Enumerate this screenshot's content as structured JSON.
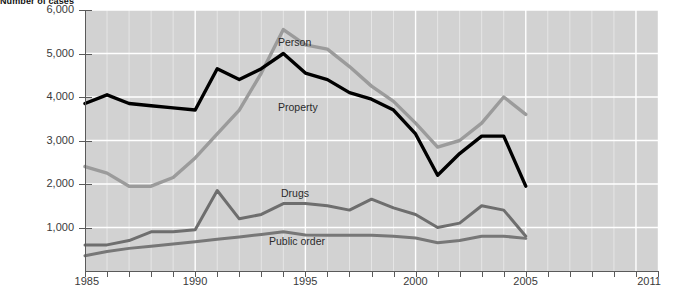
{
  "chart_title": "Number of cases",
  "axes": {
    "y_ticks": [
      "1,000",
      "2,000",
      "3,000",
      "4,000",
      "5,000",
      "6,000"
    ],
    "x_ticks": [
      "1985",
      "1990",
      "1995",
      "2000",
      "2005",
      "2011"
    ]
  },
  "series_labels": {
    "person": "Person",
    "property": "Property",
    "drugs": "Drugs",
    "public_order": "Public order"
  },
  "colors": {
    "person": "#9b9b9b",
    "property": "#000000",
    "drugs": "#6e6e6e",
    "public_order": "#777777",
    "plot_background": "#d2d2d2",
    "gridline": "#ffffff",
    "axis": "#5a5a5a"
  },
  "chart_data": {
    "type": "line",
    "title": "Number of cases",
    "xlabel": "",
    "ylabel": "Number of cases",
    "xlim": [
      1985,
      2011
    ],
    "ylim": [
      0,
      6000
    ],
    "ytick_values": [
      1000,
      2000,
      3000,
      4000,
      5000,
      6000
    ],
    "xtick_values": [
      1985,
      1990,
      1995,
      2000,
      2005,
      2011
    ],
    "grid": true,
    "legend": "inline-labels",
    "x": [
      1985,
      1986,
      1987,
      1988,
      1989,
      1990,
      1991,
      1992,
      1993,
      1994,
      1995,
      1996,
      1997,
      1998,
      1999,
      2000,
      2001,
      2002,
      2003,
      2004,
      2005
    ],
    "series": [
      {
        "name": "Person",
        "color": "#9b9b9b",
        "values": [
          2400,
          2250,
          1950,
          1950,
          2150,
          2600,
          3150,
          3700,
          4550,
          5550,
          5200,
          5100,
          4700,
          4250,
          3900,
          3400,
          2850,
          3000,
          3400,
          4000,
          3600
        ]
      },
      {
        "name": "Property",
        "color": "#000000",
        "values": [
          3850,
          4050,
          3850,
          3800,
          3750,
          3700,
          4650,
          4400,
          4650,
          5000,
          4550,
          4400,
          4100,
          3950,
          3700,
          3150,
          2200,
          2700,
          3100,
          3100,
          1950
        ]
      },
      {
        "name": "Drugs",
        "color": "#6e6e6e",
        "values": [
          600,
          600,
          700,
          900,
          900,
          950,
          1850,
          1200,
          1300,
          1550,
          1550,
          1500,
          1400,
          1650,
          1450,
          1300,
          1000,
          1100,
          1500,
          1400,
          800
        ]
      },
      {
        "name": "Public order",
        "color": "#777777",
        "values": [
          350,
          450,
          520,
          570,
          620,
          670,
          730,
          780,
          840,
          900,
          830,
          820,
          820,
          820,
          800,
          760,
          650,
          700,
          800,
          800,
          750
        ]
      }
    ]
  }
}
